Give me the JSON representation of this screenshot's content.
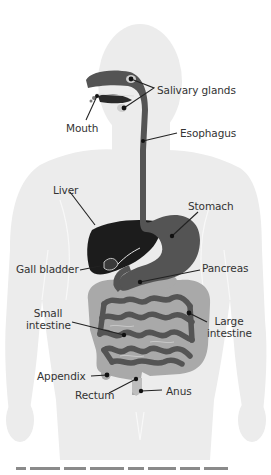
{
  "figure": {
    "colors": {
      "background": "#ffffff",
      "body_silhouette": "#ececec",
      "body_detail": "#f6f6f6",
      "tract_dark": "#545454",
      "liver": "#1c1c1c",
      "intestine_light": "#a9a9a9",
      "leader_line": "#222222"
    },
    "labels": [
      {
        "id": "salivary-glands",
        "text": "Salivary glands"
      },
      {
        "id": "mouth",
        "text": "Mouth"
      },
      {
        "id": "esophagus",
        "text": "Esophagus"
      },
      {
        "id": "liver",
        "text": "Liver"
      },
      {
        "id": "stomach",
        "text": "Stomach"
      },
      {
        "id": "gall-bladder",
        "text": "Gall bladder"
      },
      {
        "id": "pancreas",
        "text": "Pancreas"
      },
      {
        "id": "small-intestine",
        "text_line1": "Small",
        "text_line2": "intestine"
      },
      {
        "id": "large-intestine",
        "text_line1": "Large",
        "text_line2": "intestine"
      },
      {
        "id": "appendix",
        "text": "Appendix"
      },
      {
        "id": "rectum",
        "text": "Rectum"
      },
      {
        "id": "anus",
        "text": "Anus"
      }
    ],
    "caption_truncated": true
  }
}
